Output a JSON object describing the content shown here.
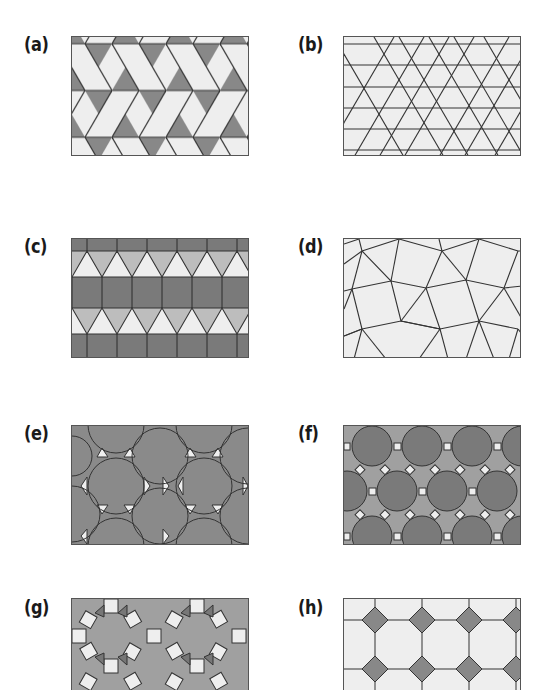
{
  "figure": {
    "panels": [
      {
        "id": "a",
        "label": "(a)",
        "description": "Trihexagonal tiling (3.6.3.6) - light hexagons, dark triangles"
      },
      {
        "id": "b",
        "label": "(b)",
        "description": "Snub hexagonal tiling (3.3.3.3.6) - light hexagons and triangles"
      },
      {
        "id": "c",
        "label": "(c)",
        "description": "Elongated triangular tiling (3.3.3.4.4) - dark square rows, alternating light triangles"
      },
      {
        "id": "d",
        "label": "(d)",
        "description": "Snub square tiling (3.3.4.3.4) - light squares and triangles"
      },
      {
        "id": "e",
        "label": "(e)",
        "description": "Truncated hexagonal tiling (3.12.12) - dark dodecagons, light triangles"
      },
      {
        "id": "f",
        "label": "(f)",
        "description": "Truncated trihexagonal tiling (4.6.12) - dark dodecagons, medium hexagons, light squares"
      },
      {
        "id": "g",
        "label": "(g)",
        "description": "Rhombitrihexagonal tiling (3.4.6.4) - medium hexagons, light squares, dark triangles"
      },
      {
        "id": "h",
        "label": "(h)",
        "description": "Truncated square tiling (4.8.8) - light octagons, dark squares"
      }
    ]
  },
  "colors": {
    "light": "#eeeeee",
    "medium": "#a8a8a8",
    "dark": "#888888",
    "darker": "#7a7a7a",
    "line": "#333333",
    "label": "#1a1a1a"
  }
}
